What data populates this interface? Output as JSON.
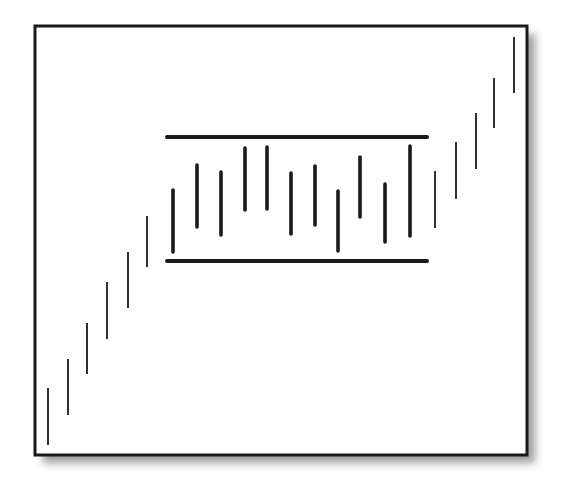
{
  "chart_data": {
    "type": "bar",
    "subtype": "ohlc-range-bars",
    "title": "",
    "xlabel": "",
    "ylabel": "",
    "grid": false,
    "legend": null,
    "frame": {
      "x": 35,
      "y": 26,
      "width": 492,
      "height": 429,
      "shadow": true
    },
    "resistance_line": {
      "x1": 167,
      "x2": 427,
      "y": 137
    },
    "support_line": {
      "x1": 167,
      "x2": 427,
      "y": 261
    },
    "bars": [
      {
        "x": 48,
        "y_high": 388,
        "y_low": 445,
        "weight": "thin",
        "phase": "uptrend"
      },
      {
        "x": 68,
        "y_high": 359,
        "y_low": 415,
        "weight": "thin",
        "phase": "uptrend"
      },
      {
        "x": 87,
        "y_high": 323,
        "y_low": 374,
        "weight": "thin",
        "phase": "uptrend"
      },
      {
        "x": 107,
        "y_high": 282,
        "y_low": 339,
        "weight": "thin",
        "phase": "uptrend"
      },
      {
        "x": 128,
        "y_high": 252,
        "y_low": 308,
        "weight": "thin",
        "phase": "uptrend"
      },
      {
        "x": 147,
        "y_high": 216,
        "y_low": 267,
        "weight": "thin",
        "phase": "uptrend"
      },
      {
        "x": 173,
        "y_high": 190,
        "y_low": 252,
        "weight": "thick",
        "phase": "range"
      },
      {
        "x": 197,
        "y_high": 165,
        "y_low": 227,
        "weight": "thick",
        "phase": "range"
      },
      {
        "x": 221,
        "y_high": 172,
        "y_low": 235,
        "weight": "thick",
        "phase": "range"
      },
      {
        "x": 245,
        "y_high": 148,
        "y_low": 210,
        "weight": "thick",
        "phase": "range"
      },
      {
        "x": 267,
        "y_high": 147,
        "y_low": 209,
        "weight": "thick",
        "phase": "range"
      },
      {
        "x": 291,
        "y_high": 173,
        "y_low": 234,
        "weight": "thick",
        "phase": "range"
      },
      {
        "x": 315,
        "y_high": 166,
        "y_low": 225,
        "weight": "thick",
        "phase": "range"
      },
      {
        "x": 338,
        "y_high": 191,
        "y_low": 251,
        "weight": "thick",
        "phase": "range"
      },
      {
        "x": 360,
        "y_high": 157,
        "y_low": 217,
        "weight": "thick",
        "phase": "range"
      },
      {
        "x": 385,
        "y_high": 184,
        "y_low": 242,
        "weight": "thick",
        "phase": "range"
      },
      {
        "x": 410,
        "y_high": 146,
        "y_low": 236,
        "weight": "thick",
        "phase": "range"
      },
      {
        "x": 435,
        "y_high": 171,
        "y_low": 228,
        "weight": "thin",
        "phase": "uptrend"
      },
      {
        "x": 456,
        "y_high": 142,
        "y_low": 199,
        "weight": "thin",
        "phase": "uptrend"
      },
      {
        "x": 476,
        "y_high": 113,
        "y_low": 169,
        "weight": "thin",
        "phase": "uptrend"
      },
      {
        "x": 494,
        "y_high": 78,
        "y_low": 128,
        "weight": "thin",
        "phase": "uptrend"
      },
      {
        "x": 514,
        "y_high": 37,
        "y_low": 93,
        "weight": "thin",
        "phase": "uptrend"
      }
    ]
  },
  "colors": {
    "background": "#ffffff",
    "frame": "#1a1a1a",
    "bars": "#1a1a1a",
    "lines": "#1a1a1a",
    "shadow": "#8a8a8a"
  }
}
